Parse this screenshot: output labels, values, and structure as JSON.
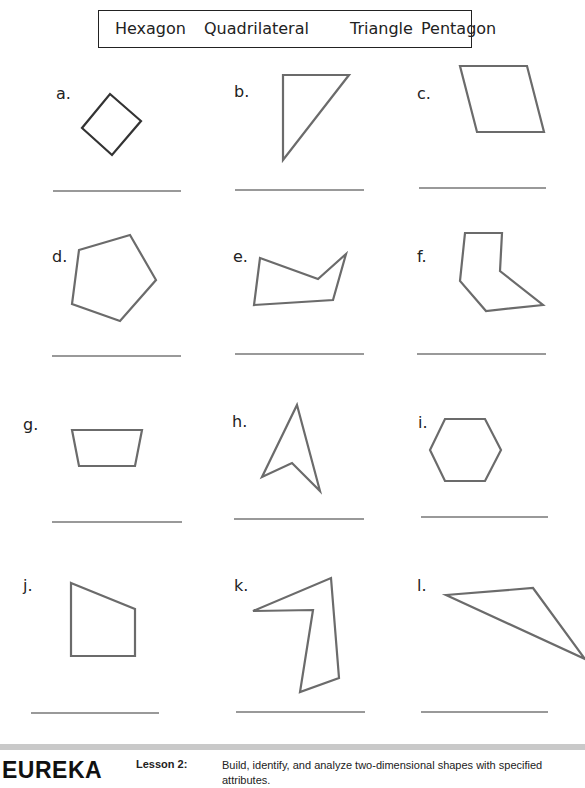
{
  "word_bank": {
    "words": [
      "Hexagon",
      "Quadrilateral",
      "Triangle",
      "Pentagon"
    ]
  },
  "problems": [
    {
      "label": "a.",
      "shape": "square (rotated)",
      "answer": ""
    },
    {
      "label": "b.",
      "shape": "right triangle",
      "answer": ""
    },
    {
      "label": "c.",
      "shape": "parallelogram",
      "answer": ""
    },
    {
      "label": "d.",
      "shape": "pentagon",
      "answer": ""
    },
    {
      "label": "e.",
      "shape": "concave pentagon",
      "answer": ""
    },
    {
      "label": "f.",
      "shape": "concave hexagon",
      "answer": ""
    },
    {
      "label": "g.",
      "shape": "trapezoid",
      "answer": ""
    },
    {
      "label": "h.",
      "shape": "concave quadrilateral (arrowhead)",
      "answer": ""
    },
    {
      "label": "i.",
      "shape": "hexagon",
      "answer": ""
    },
    {
      "label": "j.",
      "shape": "pentagon",
      "answer": ""
    },
    {
      "label": "k.",
      "shape": "concave pentagon",
      "answer": ""
    },
    {
      "label": "l.",
      "shape": "obtuse triangle",
      "answer": ""
    }
  ],
  "colors": {
    "shape_stroke": "#6b6b6b",
    "shape_a_stroke": "#333333",
    "answer_line": "#777777",
    "footer_rule": "#c9c9c9"
  },
  "footer": {
    "logo": "EUREKA",
    "lesson_label": "Lesson 2:",
    "lesson_description": "Build, identify, and analyze two-dimensional shapes with specified attributes."
  }
}
